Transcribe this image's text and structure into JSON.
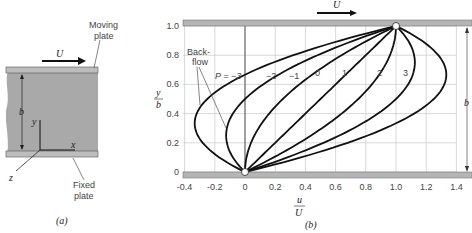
{
  "panel_a": {
    "caption": "(a)",
    "labels": {
      "moving_plate_1": "Moving",
      "moving_plate_2": "plate",
      "fixed_plate_1": "Fixed",
      "fixed_plate_2": "plate",
      "velocity": "U",
      "gap": "b",
      "axis_x": "x",
      "axis_y": "y",
      "axis_z": "z"
    }
  },
  "panel_b": {
    "caption": "(b)",
    "velocity": "U",
    "gap": "b",
    "backflow_1": "Back-",
    "backflow_2": "flow",
    "p_label": "P = −3",
    "curve_labels": [
      "−2",
      "−1",
      "0",
      "1",
      "2",
      "3"
    ],
    "xlabel_num": "u",
    "xlabel_den": "U",
    "ylabel_num": "y",
    "ylabel_den": "b",
    "xticks": [
      "-0.4",
      "-0.2",
      "0",
      "0.2",
      "0.4",
      "0.6",
      "0.8",
      "1.0",
      "1.2",
      "1.4"
    ],
    "yticks": [
      "0",
      "0.2",
      "0.4",
      "0.6",
      "0.8",
      "1.0"
    ]
  },
  "chart_data": {
    "type": "line",
    "xlabel": "u/U",
    "ylabel": "y/b",
    "xlim": [
      -0.4,
      1.4
    ],
    "ylim": [
      0,
      1.0
    ],
    "grid": true,
    "formula": "u/U = y/b + P (y/b)(1 - y/b)",
    "series": [
      {
        "name": "P = -3",
        "P": -3
      },
      {
        "name": "P = -2",
        "P": -2
      },
      {
        "name": "P = -1",
        "P": -1
      },
      {
        "name": "P = 0",
        "P": 0
      },
      {
        "name": "P = 1",
        "P": 1
      },
      {
        "name": "P = 2",
        "P": 2
      },
      {
        "name": "P = 3",
        "P": 3
      }
    ],
    "annotations": [
      "Back-flow",
      "U",
      "b"
    ]
  }
}
